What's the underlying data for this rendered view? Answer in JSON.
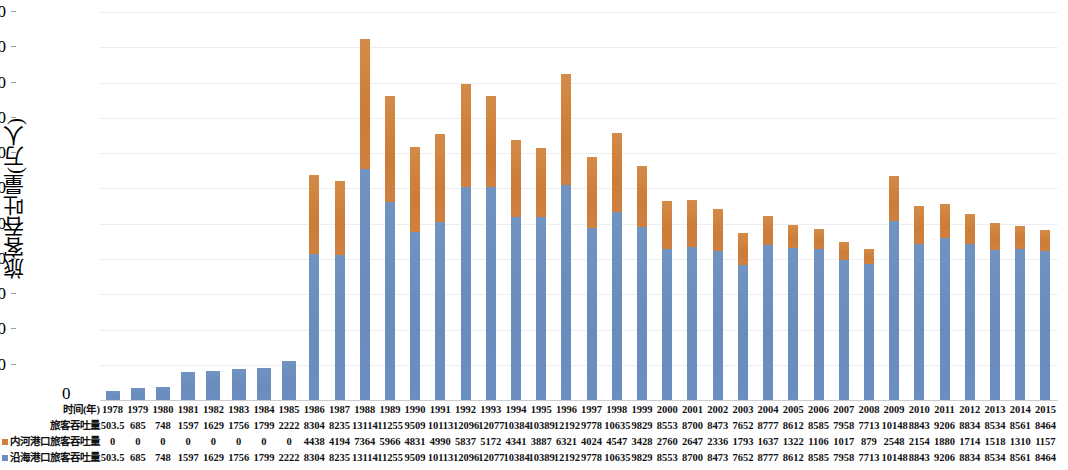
{
  "chart_data": {
    "type": "bar",
    "stacked": true,
    "title": "",
    "xlabel": "时间(年)",
    "ylabel": "旅客吞吐量(万人)",
    "ylim": [
      0,
      22000
    ],
    "ytick_step": 2000,
    "yticks": [
      "22000",
      "20000",
      "18000",
      "16000",
      "14000",
      "12000",
      "10000",
      "8000",
      "6000",
      "4000",
      "2000",
      "0"
    ],
    "grid": true,
    "legend_position": "bottom-left-table",
    "categories": [
      "1978",
      "1979",
      "1980",
      "1981",
      "1982",
      "1983",
      "1984",
      "1985",
      "1986",
      "1987",
      "1988",
      "1989",
      "1990",
      "1991",
      "1992",
      "1993",
      "1994",
      "1995",
      "1996",
      "1997",
      "1998",
      "1999",
      "2000",
      "2001",
      "2002",
      "2003",
      "2004",
      "2005",
      "2006",
      "2007",
      "2008",
      "2009",
      "2010",
      "2011",
      "2012",
      "2013",
      "2014",
      "2015"
    ],
    "series": [
      {
        "name": "沿海港口旅客吞吐量",
        "color": "#6c8fbf",
        "values": [
          503.5,
          685,
          748,
          1597,
          1629,
          1756,
          1799,
          2222,
          8304,
          8235,
          13114,
          11255,
          9509,
          10113,
          12096,
          12077,
          10384,
          10389,
          12192,
          9778,
          10635,
          9829,
          8553,
          8700,
          8473,
          7652,
          8777,
          8612,
          8585,
          7958,
          7713,
          10148,
          8843,
          9206,
          8834,
          8534,
          8561,
          8464
        ]
      },
      {
        "name": "内河港口旅客吞吐量",
        "color": "#cf8240",
        "values": [
          0,
          0,
          0,
          0,
          0,
          0,
          0,
          0,
          4438,
          4194,
          7364,
          5966,
          4831,
          4990,
          5837,
          5172,
          4341,
          3887,
          6321,
          4024,
          4511,
          3428,
          2760,
          2647,
          2336,
          1793,
          1637,
          1322,
          1106,
          1017,
          879,
          2548,
          2154,
          1880,
          1714,
          1518,
          1310,
          1157
        ]
      }
    ]
  },
  "table": {
    "row_labels": {
      "years": "时间(年)",
      "total": "旅客吞吐量",
      "inland": "内河港口旅客吞吐量",
      "coastal": "沿海港口旅客吞吐量"
    },
    "origin_label": "0",
    "years": [
      "1978",
      "1979",
      "1980",
      "1981",
      "1982",
      "1983",
      "1984",
      "1985",
      "1986",
      "1987",
      "1988",
      "1989",
      "1990",
      "1991",
      "1992",
      "1993",
      "1994",
      "1995",
      "1996",
      "1997",
      "1998",
      "1999",
      "2000",
      "2001",
      "2002",
      "2003",
      "2004",
      "2005",
      "2006",
      "2007",
      "2008",
      "2009",
      "2010",
      "2011",
      "2012",
      "2013",
      "2014",
      "2015"
    ],
    "total": [
      "503.5",
      "685",
      "748",
      "1597",
      "1629",
      "1756",
      "1799",
      "2222",
      "8304",
      "8235",
      "13114",
      "11255",
      "9509",
      "10113",
      "12096",
      "12077",
      "10384",
      "10389",
      "12192",
      "9778",
      "10635",
      "9829",
      "8553",
      "8700",
      "8473",
      "7652",
      "8777",
      "8612",
      "8585",
      "7958",
      "7713",
      "10148",
      "8843",
      "9206",
      "8834",
      "8534",
      "8561",
      "8464"
    ],
    "inland": [
      "0",
      "0",
      "0",
      "0",
      "0",
      "0",
      "0",
      "0",
      "4438",
      "4194",
      "7364",
      "5966",
      "4831",
      "4990",
      "5837",
      "5172",
      "4341",
      "3887",
      "6321",
      "4024",
      "4547",
      "3428",
      "2760",
      "2647",
      "2336",
      "1793",
      "1637",
      "1322",
      "1106",
      "1017",
      "879",
      "2548",
      "2154",
      "1880",
      "1714",
      "1518",
      "1310",
      "1157"
    ],
    "coastal": [
      "503.5",
      "685",
      "748",
      "1597",
      "1629",
      "1756",
      "1799",
      "2222",
      "8304",
      "8235",
      "13114",
      "11255",
      "9509",
      "10113",
      "12096",
      "12077",
      "10384",
      "10389",
      "12192",
      "9778",
      "10635",
      "9829",
      "8553",
      "8700",
      "8473",
      "7652",
      "8777",
      "8612",
      "8585",
      "7958",
      "7713",
      "10148",
      "8843",
      "9206",
      "8834",
      "8534",
      "8561",
      "8464"
    ]
  }
}
